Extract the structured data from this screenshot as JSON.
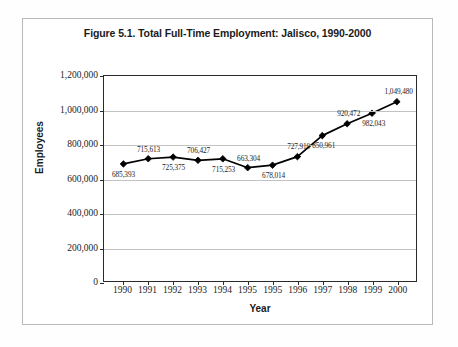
{
  "figure": {
    "title": "Figure 5.1. Total Full-Time Employment: Jalisco, 1990-2000",
    "axis_title_x": "Year",
    "axis_title_y": "Employees"
  },
  "chart_data": {
    "type": "line",
    "title": "Figure 5.1. Total Full-Time Employment: Jalisco, 1990-2000",
    "xlabel": "Year",
    "ylabel": "Employees",
    "categories": [
      "1990",
      "1991",
      "1992",
      "1993",
      "1994",
      "1995",
      "1995",
      "1996",
      "1997",
      "1998",
      "1999",
      "2000"
    ],
    "values": [
      685393,
      715613,
      725375,
      706427,
      715253,
      663304,
      678014,
      727910,
      850961,
      920472,
      982043,
      1049480
    ],
    "point_labels": [
      "685,393",
      "715,613",
      "725,375",
      "706,427",
      "715,253",
      "663,304",
      "678,014",
      "727,910",
      "850,961",
      "920,472",
      "982,043",
      "1,049,480"
    ],
    "label_positions": [
      "below",
      "above",
      "below",
      "above",
      "below",
      "above",
      "below",
      "above",
      "below",
      "above",
      "below",
      "above"
    ],
    "ylim": [
      0,
      1200000
    ],
    "ytick_values": [
      0,
      200000,
      400000,
      600000,
      800000,
      1000000,
      1200000
    ],
    "ytick_labels": [
      "0",
      "200,000",
      "400,000",
      "600,000",
      "800,000",
      "1,000,000",
      "1,200,000"
    ],
    "grid": "horizontal",
    "legend": "none",
    "marker": "diamond",
    "line_color": "#000000",
    "marker_color": "#000000",
    "gridline_color": "#c2c2c2",
    "axis_color": "#2a2a2a",
    "background_color": "#ffffff"
  }
}
